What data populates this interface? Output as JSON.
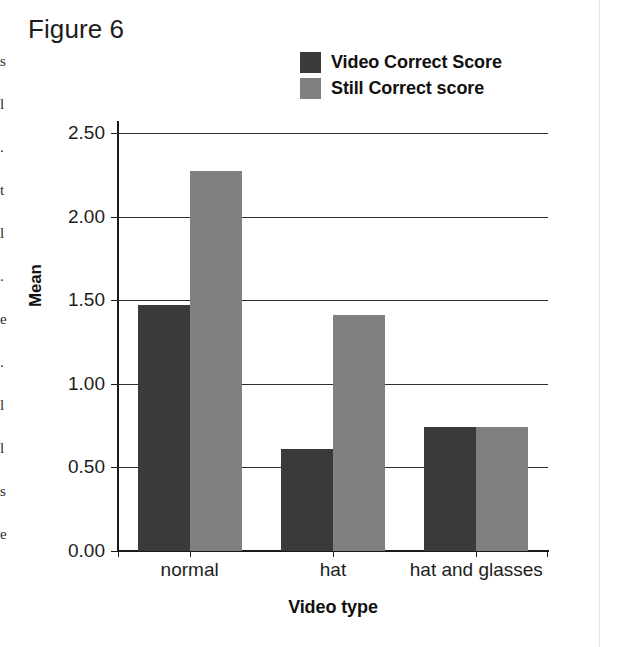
{
  "figure": {
    "title": "Figure 6"
  },
  "scan_artifacts": {
    "left_column_fragments": "s\nl\n.\nt\nl\n.\ne\n.\nl\nl\ns\ne",
    "right_gutter_color": "#e8e8e8"
  },
  "legend": {
    "position": "top-right",
    "entries": [
      {
        "label": "Video Correct Score",
        "color": "#3a3a3a",
        "swatch_icon": "square-swatch-icon"
      },
      {
        "label": "Still Correct score",
        "color": "#808080",
        "swatch_icon": "square-swatch-icon"
      }
    ]
  },
  "axes": {
    "y": {
      "label": "Mean",
      "ticks": [
        "0.00",
        "0.50",
        "1.00",
        "1.50",
        "2.00",
        "2.50"
      ],
      "min": 0,
      "max": 2.5,
      "step": 0.5
    },
    "x": {
      "label": "Video type",
      "ticks": [
        "normal",
        "hat",
        "hat and glasses"
      ]
    }
  },
  "chart_data": {
    "type": "bar",
    "title": "Figure 6",
    "xlabel": "Video type",
    "ylabel": "Mean",
    "categories": [
      "normal",
      "hat",
      "hat and glasses"
    ],
    "series": [
      {
        "name": "Video Correct Score",
        "color": "#3a3a3a",
        "values": [
          1.47,
          0.61,
          0.74
        ]
      },
      {
        "name": "Still Correct score",
        "color": "#808080",
        "values": [
          2.27,
          1.41,
          0.74
        ]
      }
    ],
    "ylim": [
      0,
      2.5
    ],
    "ytick_step": 0.5,
    "ytick_labels": [
      "0.00",
      "0.50",
      "1.00",
      "1.50",
      "2.00",
      "2.50"
    ],
    "grid": "horizontal",
    "legend_position": "top-right",
    "bar_group_layout": "grouped-adjacent"
  }
}
